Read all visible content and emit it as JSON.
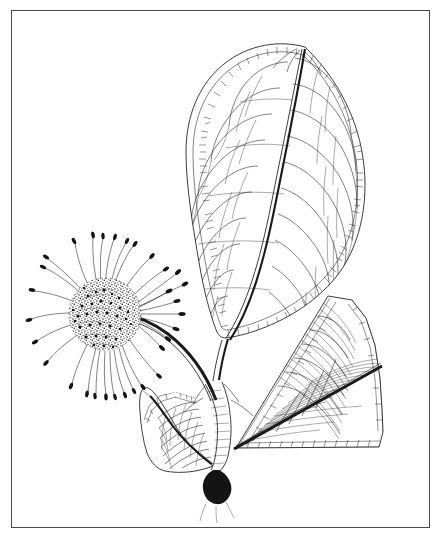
{
  "plate": {
    "title": "Botanical line illustration",
    "subject": "Flowering branch with leaves and globose capitulum",
    "medium": "pen-and-ink line drawing",
    "background_color": "#ffffff",
    "ink_color": "#1a1a1a",
    "frame": {
      "present": true,
      "color": "#4a4a4a",
      "stroke_px": 1.4,
      "x": 11,
      "y": 10,
      "width": 419,
      "height": 518
    },
    "caption": "",
    "label_text": ""
  },
  "figure_parts": [
    {
      "id": "main-leaf",
      "name": "Main leaf (upper, full face view)",
      "description": "Large obovate-elliptic leaf, acuminate apex, cuneate base, pinnate venation with brochidodromous looping secondaries and a reticulate marginal areole band.",
      "venation": "brochidodromous",
      "secondary_vein_pairs": 11,
      "margin": "entire"
    },
    {
      "id": "lower-right-leaf",
      "name": "Lower right leaf (foreshortened)",
      "description": "Leaf seen in strong perspective, dark oblique midrib running lower-left to upper-right, dense fine secondary and tertiary venation with marginal areoles.",
      "venation": "pinnate",
      "secondary_vein_pairs": 14,
      "margin": "entire"
    },
    {
      "id": "lower-left-leaf",
      "name": "Lower left leaf (foreshortened)",
      "description": "Leaf tilted away from viewer, dark midrib to the left, arching secondaries forming loops.",
      "venation": "pinnate",
      "secondary_vein_pairs": 9,
      "margin": "entire"
    },
    {
      "id": "capitulum",
      "name": "Globose flower head (capitulum)",
      "description": "Dense spherical stippled receptacle bearing numerous radiating filaments, each tipped with a small elongate anther.",
      "filament_count": 34,
      "shape": "globose"
    },
    {
      "id": "peduncle",
      "name": "Peduncle",
      "description": "Thick dark curved stalk arcing from the stem node up to the flower head."
    },
    {
      "id": "stem-node",
      "name": "Stem node with stipule",
      "description": "Junction where the petioles of the three leaves and the peduncle converge; small dark stipular bract below."
    }
  ]
}
